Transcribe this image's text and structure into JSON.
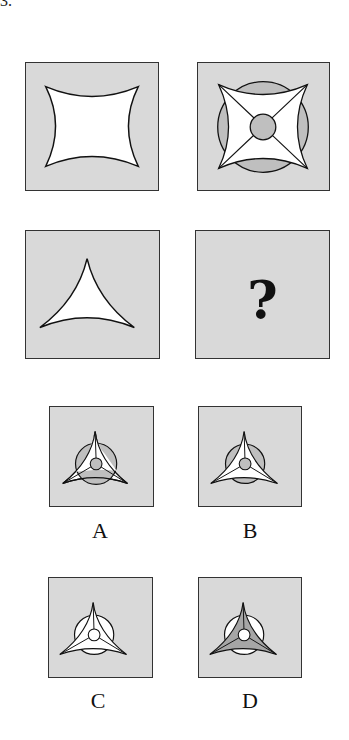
{
  "question": {
    "number": "3.",
    "prompt_grid": [
      {
        "id": "p1",
        "shape": "concave four-pointed star (astroid-like square)",
        "fill": "#ffffff"
      },
      {
        "id": "p2",
        "shape": "concave four-pointed star with diagonal lines, center circle and background circle",
        "fill": "#ffffff",
        "circle_fill": "#bfbfbf"
      },
      {
        "id": "p3",
        "shape": "concave three-pointed star (curved triangle)",
        "fill": "#ffffff"
      },
      {
        "id": "p4",
        "shape": "unknown",
        "text": "?"
      }
    ],
    "options": [
      {
        "label": "A",
        "star_fill": "#ffffff",
        "circle_fill": "#bfbfbf",
        "center_fill": "#bfbfbf",
        "circle_over_star": true
      },
      {
        "label": "B",
        "star_fill": "#ffffff",
        "circle_fill": "#bfbfbf",
        "center_fill": "#bfbfbf",
        "circle_over_star": false
      },
      {
        "label": "C",
        "star_fill": "#ffffff",
        "circle_fill": "#ffffff",
        "center_fill": "#ffffff",
        "circle_over_star": false
      },
      {
        "label": "D",
        "star_fill": "#a6a6a6",
        "circle_fill": "#ffffff",
        "center_fill": "#ffffff",
        "circle_over_star": false
      }
    ]
  },
  "colors": {
    "panel_bg": "#d9d9d9",
    "border": "#333333",
    "gray_fill": "#bfbfbf"
  }
}
